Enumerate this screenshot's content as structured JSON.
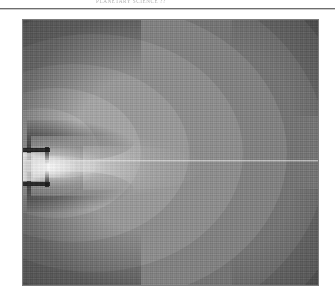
{
  "page": {
    "running_head": "PLANETARY SCIENCE ??",
    "background_color": "#ffffff",
    "rule_color": "#6e6e6e"
  },
  "figure": {
    "name": "contour-field-plot",
    "caption": "",
    "border_color": "#7b7b7b",
    "background_color": "#5c5c5c"
  },
  "chart_data": {
    "type": "heatmap",
    "title": "",
    "subtitle": "",
    "xlabel": "",
    "ylabel": "",
    "grid": false,
    "legend": "none",
    "colormap": "grayscale",
    "axis_of_symmetry": {
      "orientation": "horizontal",
      "y_fraction": 0.53,
      "color": "#ebebeb"
    },
    "source_geometry": {
      "nozzle_x_fraction": 0.0,
      "nozzle_y_fraction": 0.53,
      "nozzle_wall_color": "#1d1d1d",
      "throat_color": "#ebebeb"
    },
    "contour_levels": [
      {
        "index": 1,
        "label": "L1",
        "gray": "#b2b2b2",
        "value": 1.0
      },
      {
        "index": 2,
        "label": "L2",
        "gray": "#a6a6a6",
        "value": 0.86
      },
      {
        "index": 3,
        "label": "L3",
        "gray": "#9a9a9a",
        "value": 0.72
      },
      {
        "index": 4,
        "label": "L4",
        "gray": "#8e8e8e",
        "value": 0.58
      },
      {
        "index": 5,
        "label": "L5",
        "gray": "#828282",
        "value": 0.44
      },
      {
        "index": 6,
        "label": "L6",
        "gray": "#757575",
        "value": 0.3
      },
      {
        "index": 7,
        "label": "L7",
        "gray": "#6a6a6a",
        "value": 0.16
      },
      {
        "index": 8,
        "label": "far-field",
        "gray": "#5c5c5c",
        "value": 0.0
      }
    ],
    "value_range": [
      0.0,
      1.0
    ],
    "peak": {
      "x_fraction": 0.04,
      "y_fraction": 0.53,
      "gray": "#ffffff",
      "value": 1.0
    },
    "dark_regions": [
      {
        "name": "upper-recirculation-lobe",
        "gray": "#141414"
      },
      {
        "name": "lower-recirculation-lobe",
        "gray": "#141414"
      },
      {
        "name": "upper-left-corner",
        "gray": "#3f3f3f"
      },
      {
        "name": "lower-left-corner",
        "gray": "#3f3f3f"
      }
    ]
  }
}
